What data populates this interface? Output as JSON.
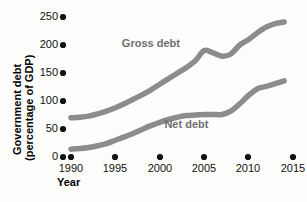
{
  "chart_data": {
    "type": "line",
    "title": "",
    "xlabel": "Year",
    "ylabel": "Government debt (percentage of GDP)",
    "xlim": [
      1989,
      2015.5
    ],
    "ylim": [
      0,
      265
    ],
    "grid": false,
    "legend_position": "inline-annotation",
    "x_ticks": [
      1990,
      1995,
      2000,
      2005,
      2010,
      2015
    ],
    "y_ticks": [
      0,
      50,
      100,
      150,
      200,
      250
    ],
    "x_tick_labels": [
      "1990",
      "1995",
      "2000",
      "2005",
      "2010",
      "2015"
    ],
    "y_tick_labels": [
      "0",
      "50",
      "100",
      "150",
      "200",
      "250"
    ],
    "x": [
      1990,
      1991,
      1992,
      1993,
      1994,
      1995,
      1996,
      1997,
      1998,
      1999,
      2000,
      2001,
      2002,
      2003,
      2004,
      2005,
      2006,
      2007,
      2008,
      2009,
      2010,
      2011,
      2012,
      2013,
      2014
    ],
    "series": [
      {
        "name": "Gross debt",
        "color": "#8c8c8c",
        "label_x": 1999,
        "label_y": 196,
        "values": [
          70,
          71,
          73,
          77,
          82,
          88,
          95,
          103,
          111,
          120,
          130,
          140,
          150,
          160,
          172,
          190,
          186,
          180,
          184,
          200,
          210,
          222,
          232,
          238,
          241
        ]
      },
      {
        "name": "Net debt",
        "color": "#8c8c8c",
        "label_x": 2003,
        "label_y": 52,
        "values": [
          14,
          15,
          17,
          20,
          24,
          30,
          36,
          42,
          49,
          56,
          62,
          67,
          71,
          74,
          75,
          76,
          76,
          76,
          82,
          95,
          110,
          122,
          126,
          131,
          136
        ]
      }
    ]
  },
  "axis_titles": {
    "y_line1": "Government debt",
    "y_line2": "(percentage of GDP)",
    "x": "Year"
  },
  "colors": {
    "background": "#fdfdfb",
    "line": "#8c8c8c",
    "tick_dot": "#111111",
    "text": "#111111",
    "series_label": "#6f6f6f"
  }
}
